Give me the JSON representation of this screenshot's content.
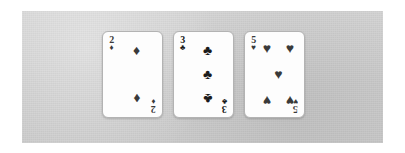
{
  "scene": {
    "title": "Three playing cards on a gray surface",
    "background_color": "#ffffff",
    "panel_color": "#cfcfcf",
    "card_face_color": "#fdfdfd",
    "card_border_color": "#b3b3b3"
  },
  "suit_glyphs": {
    "diamonds": "♦",
    "clubs": "♣",
    "hearts": "♥",
    "spades": "♠"
  },
  "hand": {
    "card_count": 3,
    "cards": [
      {
        "rank": "2",
        "suit": "diamonds",
        "suit_glyph": "♦",
        "suit_color": "#3a3a3a",
        "label": "2 of Diamonds",
        "pips": [
          {
            "x": 50,
            "y": 19,
            "flip": false
          },
          {
            "x": 50,
            "y": 81,
            "flip": true
          }
        ]
      },
      {
        "rank": "3",
        "suit": "clubs",
        "suit_glyph": "♣",
        "suit_color": "#1b1b1b",
        "label": "3 of Clubs",
        "pips": [
          {
            "x": 50,
            "y": 19,
            "flip": false
          },
          {
            "x": 50,
            "y": 50,
            "flip": false
          },
          {
            "x": 50,
            "y": 81,
            "flip": true
          }
        ]
      },
      {
        "rank": "5",
        "suit": "hearts",
        "suit_glyph": "♥",
        "suit_color": "#3a3a3a",
        "label": "5 of Hearts",
        "pips": [
          {
            "x": 22,
            "y": 17,
            "flip": false
          },
          {
            "x": 78,
            "y": 17,
            "flip": false
          },
          {
            "x": 50,
            "y": 50,
            "flip": false
          },
          {
            "x": 22,
            "y": 83,
            "flip": true
          },
          {
            "x": 78,
            "y": 83,
            "flip": true
          }
        ]
      }
    ]
  }
}
